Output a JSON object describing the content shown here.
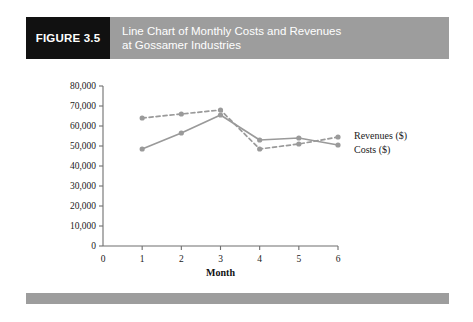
{
  "figure": {
    "tag": "FIGURE 3.5",
    "title_line_1": "Line Chart of Monthly Costs and Revenues",
    "title_line_2": "at Gossamer Industries"
  },
  "colors": {
    "tag_background": "#111111",
    "title_background": "#9d9d9d",
    "title_text": "#ffffff",
    "footer_bar": "#9d9d9d",
    "revenues_line": "#9a9a9a",
    "costs_line": "#9a9a9a",
    "axis": "#6f6f6f",
    "plot_background": "#ffffff"
  },
  "chart_data": {
    "type": "line",
    "title": "Line Chart of Monthly Costs and Revenues at Gossamer Industries",
    "xlabel": "Month",
    "ylabel": "",
    "x": [
      1,
      2,
      3,
      4,
      5,
      6
    ],
    "xlim": [
      0,
      6
    ],
    "ylim": [
      0,
      80000
    ],
    "grid": false,
    "legend_position": "right",
    "x_tick_labels": [
      "0",
      "1",
      "2",
      "3",
      "4",
      "5",
      "6"
    ],
    "x_tick_values": [
      0,
      1,
      2,
      3,
      4,
      5,
      6
    ],
    "y_tick_labels": [
      "0",
      "10,000",
      "20,000",
      "30,000",
      "40,000",
      "50,000",
      "60,000",
      "70,000",
      "80,000"
    ],
    "y_tick_values": [
      0,
      10000,
      20000,
      30000,
      40000,
      50000,
      60000,
      70000,
      80000
    ],
    "series": [
      {
        "name": "Revenues ($)",
        "style": "dashed",
        "color": "#9a9a9a",
        "values": [
          64000,
          66000,
          68000,
          48500,
          51000,
          54500
        ]
      },
      {
        "name": "Costs ($)",
        "style": "solid",
        "color": "#9a9a9a",
        "values": [
          48500,
          56500,
          65500,
          53000,
          54000,
          50500
        ]
      }
    ]
  }
}
